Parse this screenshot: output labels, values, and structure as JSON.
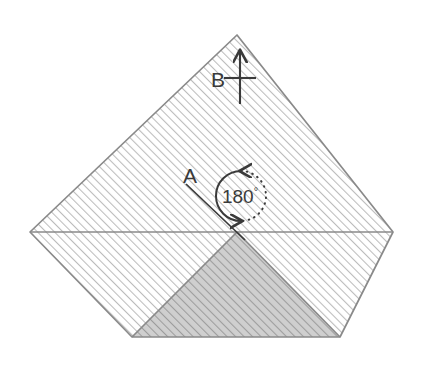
{
  "canvas": {
    "width": 447,
    "height": 367,
    "background": "#ffffff"
  },
  "diagram": {
    "type": "geometry-folding-diagram",
    "colors": {
      "outline": "#808080",
      "hatch_light": "#b4b4b4",
      "fill_light": "#ffffff",
      "fill_dark": "#c8c8c8",
      "hatch_dark": "#9a9a9a",
      "annotation": "#3a3a3a",
      "text": "#3a3a3a"
    },
    "shape": {
      "name": "folded-square-sheet",
      "outline_points": "237,35 393,232 340,337 132,337 30,232",
      "vertices": {
        "top": [
          237,
          35
        ],
        "left": [
          30,
          232
        ],
        "right": [
          393,
          232
        ],
        "bottom_left": [
          132,
          337
        ],
        "bottom_right": [
          340,
          337
        ],
        "center_fold": [
          237,
          232
        ]
      }
    },
    "regions": [
      {
        "name": "upper-sheet",
        "points": "237,35 393,232 237,232 30,232",
        "shade": "light"
      },
      {
        "name": "lower-left-flap",
        "points": "30,232 237,232 132,337",
        "shade": "light"
      },
      {
        "name": "lower-right-flap",
        "points": "237,232 393,232 340,337",
        "shade": "light"
      },
      {
        "name": "folded-under-triangle",
        "points": "132,337 237,232 340,337",
        "shade": "dark"
      }
    ],
    "fold_lines": [
      {
        "name": "fold-line-left",
        "from": [
          30,
          232
        ],
        "to": [
          237,
          232
        ]
      },
      {
        "name": "fold-line-right",
        "from": [
          237,
          232
        ],
        "to": [
          393,
          232
        ]
      },
      {
        "name": "crease-left",
        "from": [
          132,
          337
        ],
        "to": [
          237,
          232
        ]
      },
      {
        "name": "crease-right",
        "from": [
          237,
          232
        ],
        "to": [
          340,
          337
        ]
      }
    ],
    "annotations": {
      "axis_b": {
        "label": "B",
        "label_x": 218,
        "label_y": 87,
        "arrow_from": [
          240,
          104
        ],
        "arrow_to": [
          240,
          48
        ],
        "crossbar_from": [
          225,
          78
        ],
        "crossbar_to": [
          255,
          78
        ]
      },
      "axis_a": {
        "label": "A",
        "label_x": 189,
        "label_y": 184,
        "line_from": [
          185,
          185
        ],
        "line_to": [
          243,
          238
        ]
      },
      "rotation": {
        "label": "180",
        "degree_symbol": "°",
        "value": 180,
        "unit": "degrees",
        "center": [
          241,
          196
        ],
        "radius": 25,
        "solid_arc_side": "left",
        "dotted_arc_side": "right",
        "arrowhead_top": "clockwise",
        "arrowhead_bottom": "clockwise",
        "text_x": 241,
        "text_y": 202
      }
    }
  }
}
